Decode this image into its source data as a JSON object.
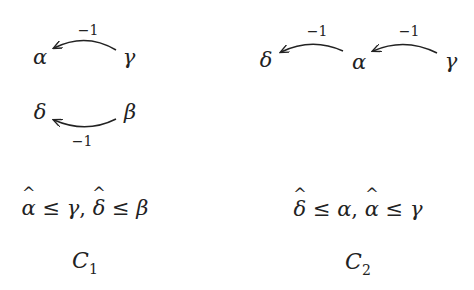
{
  "diagrams": [
    {
      "name": "C1",
      "nodes": [
        {
          "id": "alpha",
          "label": "α"
        },
        {
          "id": "gamma",
          "label": "γ"
        },
        {
          "id": "delta",
          "label": "δ"
        },
        {
          "id": "beta",
          "label": "β"
        }
      ],
      "edges": [
        {
          "from": "γ",
          "to": "α",
          "weight": "−1"
        },
        {
          "from": "β",
          "to": "δ",
          "weight": "−1"
        }
      ],
      "constraint": {
        "part1": {
          "hat": "α",
          "rel": "≤",
          "rhs": "γ",
          "sep": ","
        },
        "part2": {
          "hat": "δ",
          "rel": "≤",
          "rhs": "β"
        }
      },
      "caption": {
        "letter": "C",
        "index": "1"
      }
    },
    {
      "name": "C2",
      "nodes": [
        {
          "id": "delta",
          "label": "δ"
        },
        {
          "id": "alpha",
          "label": "α"
        },
        {
          "id": "gamma",
          "label": "γ"
        }
      ],
      "edges": [
        {
          "from": "α",
          "to": "δ",
          "weight": "−1"
        },
        {
          "from": "γ",
          "to": "α",
          "weight": "−1"
        }
      ],
      "constraint": {
        "part1": {
          "hat": "δ",
          "rel": "≤",
          "rhs": "α",
          "sep": ","
        },
        "part2": {
          "hat": "α",
          "rel": "≤",
          "rhs": "γ"
        }
      },
      "caption": {
        "letter": "C",
        "index": "2"
      }
    }
  ],
  "hat_glyph": "^",
  "colors": {
    "ink": "#222222",
    "background": "#ffffff"
  }
}
